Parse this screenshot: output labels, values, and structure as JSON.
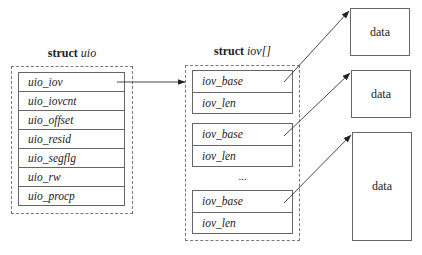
{
  "uio": {
    "title_keyword": "struct",
    "title_name": "uio",
    "fields": [
      "uio_iov",
      "uio_iovcnt",
      "uio_offset",
      "uio_resid",
      "uio_segflg",
      "uio_rw",
      "uio_procp"
    ]
  },
  "iov": {
    "title_keyword": "struct",
    "title_name": "iov[]",
    "entries": [
      {
        "base": "iov_base",
        "len": "iov_len"
      },
      {
        "base": "iov_base",
        "len": "iov_len"
      },
      {
        "base": "iov_base",
        "len": "iov_len"
      }
    ],
    "ellipsis": "..."
  },
  "data_blocks": [
    {
      "label": "data"
    },
    {
      "label": "data"
    },
    {
      "label": "data"
    }
  ],
  "colors": {
    "line": "#666666",
    "dashed": "#777777",
    "arrow": "#333333"
  }
}
